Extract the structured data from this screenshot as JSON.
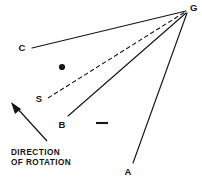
{
  "figure": {
    "background_color": "#ffffff",
    "ink_color": "#161616",
    "width": 202,
    "height": 182
  },
  "caption": {
    "line1": "DIRECTION",
    "line2": "OF ROTATION"
  },
  "points": [
    {
      "id": "G",
      "label": "G",
      "x": 190,
      "y": 9,
      "label_x": 190,
      "label_y": 11
    },
    {
      "id": "C",
      "label": "C",
      "x": 32,
      "y": 48,
      "label_x": 22,
      "label_y": 51
    },
    {
      "id": "S",
      "label": "S",
      "x": 48,
      "y": 99,
      "label_x": 39,
      "label_y": 102
    },
    {
      "id": "B",
      "label": "B",
      "x": 68,
      "y": 117,
      "label_x": 62,
      "label_y": 127
    },
    {
      "id": "A",
      "label": "A",
      "x": 133,
      "y": 163,
      "label_x": 128,
      "label_y": 174
    }
  ],
  "rays": [
    {
      "id": "ray-C-G",
      "from": "C",
      "to": "G",
      "style": "solid",
      "x1": 32,
      "y1": 48,
      "x2": 186,
      "y2": 11
    },
    {
      "id": "ray-S-G",
      "from": "S",
      "to": "G",
      "style": "dashed",
      "x1": 48,
      "y1": 98,
      "x2": 185,
      "y2": 12
    },
    {
      "id": "ray-B-G",
      "from": "B",
      "to": "G",
      "style": "solid",
      "x1": 68,
      "y1": 116,
      "x2": 186,
      "y2": 13
    },
    {
      "id": "ray-A-G",
      "from": "A",
      "to": "G",
      "style": "solid",
      "x1": 133,
      "y1": 163,
      "x2": 187,
      "y2": 13
    }
  ],
  "rotation_arrow": {
    "id": "rotation-arrow",
    "tail_x": 47,
    "tail_y": 141,
    "head_x": 12,
    "head_y": 103,
    "direction": "up-left"
  },
  "markers": {
    "center_dot": {
      "x": 62,
      "y": 67,
      "radius": 3.1
    },
    "dash_mark": {
      "x1": 96,
      "y1": 123,
      "x2": 108,
      "y2": 123
    }
  }
}
